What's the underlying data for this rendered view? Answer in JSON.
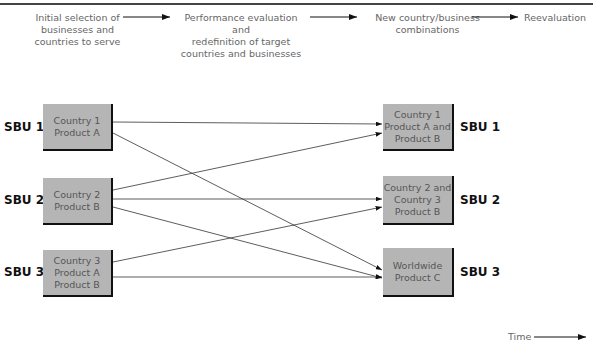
{
  "header": {
    "steps": [
      "Initial selection of\nbusinesses and\ncountries to serve",
      "Performance evaluation and\nredefinition of target\ncountries and businesses",
      "New country/business\ncombinations",
      "Reevaluation"
    ]
  },
  "left_boxes": [
    {
      "sbu": "SBU 1",
      "label": "Country 1\nProduct  A"
    },
    {
      "sbu": "SBU 2",
      "label": "Country 2\nProduct  B"
    },
    {
      "sbu": "SBU 3",
      "label": "Country 3\nProduct  A\nProduct  B"
    }
  ],
  "right_boxes": [
    {
      "sbu": "SBU 1",
      "label": "Country 1\nProduct  A and\nProduct  B"
    },
    {
      "sbu": "SBU 2",
      "label": "Country 2 and\nCountry 3\nProduct  B"
    },
    {
      "sbu": "SBU 3",
      "label": "Worldwide\nProduct C"
    }
  ],
  "connections": [
    {
      "from": 0,
      "to": 0
    },
    {
      "from": 0,
      "to": 2
    },
    {
      "from": 1,
      "to": 0
    },
    {
      "from": 1,
      "to": 1
    },
    {
      "from": 1,
      "to": 2
    },
    {
      "from": 2,
      "to": 1
    },
    {
      "from": 2,
      "to": 2
    }
  ],
  "time_label": "Time"
}
